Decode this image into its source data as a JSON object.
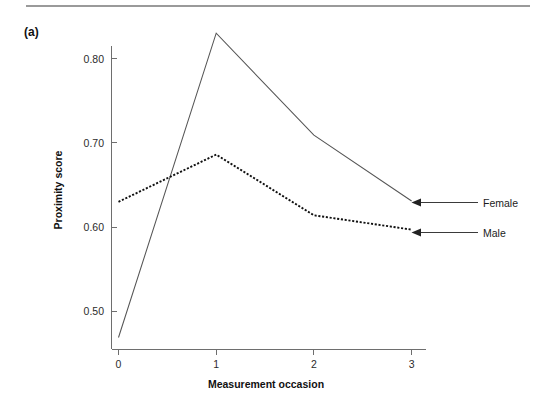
{
  "figure": {
    "panel_label": "(a)",
    "rule_color": "#9a9a9a"
  },
  "chart_data": {
    "type": "line",
    "title": "",
    "xlabel": "Measurement occasion",
    "ylabel": "Proximity score",
    "x": [
      0,
      1,
      2,
      3
    ],
    "xticklabels": [
      "0",
      "1",
      "2",
      "3"
    ],
    "yticklabels": [
      "0.50",
      "0.60",
      "0.70",
      "0.80"
    ],
    "yticks": [
      0.5,
      0.6,
      0.7,
      0.8
    ],
    "xlim": [
      -0.12,
      3.25
    ],
    "ylim": [
      0.455,
      0.845
    ],
    "grid": false,
    "legend_position": "right-annotations",
    "series": [
      {
        "name": "Female",
        "style": "solid",
        "color": "#555555",
        "values": [
          0.469,
          0.83,
          0.709,
          0.631
        ]
      },
      {
        "name": "Male",
        "style": "dotted",
        "color": "#111111",
        "values": [
          0.63,
          0.686,
          0.614,
          0.597
        ]
      }
    ],
    "annotations": [
      {
        "label": "Female",
        "points_to_series": "Female",
        "points_to_x": 3,
        "points_to_y": 0.631
      },
      {
        "label": "Male",
        "points_to_series": "Male",
        "points_to_x": 3,
        "points_to_y": 0.597
      }
    ]
  }
}
